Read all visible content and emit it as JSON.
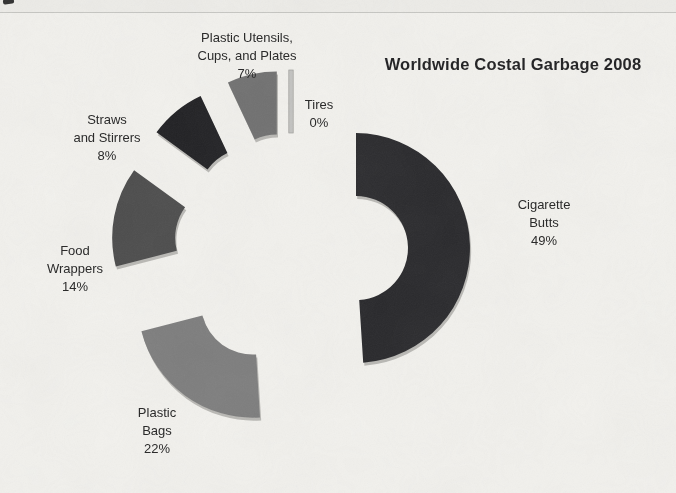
{
  "page": {
    "background_color": "#f2f1ed",
    "top_rule_color": "#c6c6c2"
  },
  "chart_data": {
    "type": "pie",
    "subtype": "exploded_doughnut",
    "title": "Worldwide Costal Garbage 2008",
    "categories": [
      "Cigarette Butts",
      "Plastic Bags",
      "Food Wrappers",
      "Straws and Stirrers",
      "Plastic Utensils, Cups, and Plates",
      "Tires"
    ],
    "values": [
      49,
      22,
      14,
      8,
      7,
      0
    ],
    "unit": "%",
    "legend_position": "none",
    "data_labels": "category name and percentage",
    "bevel_color": "#b9b8b4",
    "geometry": {
      "cx": 291,
      "cy": 250,
      "outer_radius": 115,
      "inner_radius": 52,
      "explode": 65,
      "start_angle": 0,
      "direction": "clockwise"
    },
    "slices": [
      {
        "id": "cigarette-butts",
        "value": 49,
        "color": "#28282b",
        "label_lines": [
          "Cigarette",
          "Butts",
          "49%"
        ],
        "label_x": 544,
        "label_y": 196
      },
      {
        "id": "plastic-bags",
        "value": 22,
        "color": "#7d7d7d",
        "label_lines": [
          "Plastic",
          "Bags",
          "22%"
        ],
        "label_x": 157,
        "label_y": 404
      },
      {
        "id": "food-wrappers",
        "value": 14,
        "color": "#4b4b4b",
        "label_lines": [
          "Food",
          "Wrappers",
          "14%"
        ],
        "label_x": 75,
        "label_y": 242
      },
      {
        "id": "straws-and-stirrers",
        "value": 8,
        "color": "#202023",
        "label_lines": [
          "Straws",
          "and Stirrers",
          "8%"
        ],
        "label_x": 107,
        "label_y": 111
      },
      {
        "id": "plastic-utensils-cups-and-plates",
        "value": 7,
        "color": "#707070",
        "label_lines": [
          "Plastic Utensils,",
          "Cups, and Plates",
          "7%"
        ],
        "label_x": 247,
        "label_y": 29
      },
      {
        "id": "tires",
        "value": 0,
        "color": "#c2c2c0",
        "label_lines": [
          "Tires",
          "0%"
        ],
        "label_x": 319,
        "label_y": 96
      }
    ]
  }
}
